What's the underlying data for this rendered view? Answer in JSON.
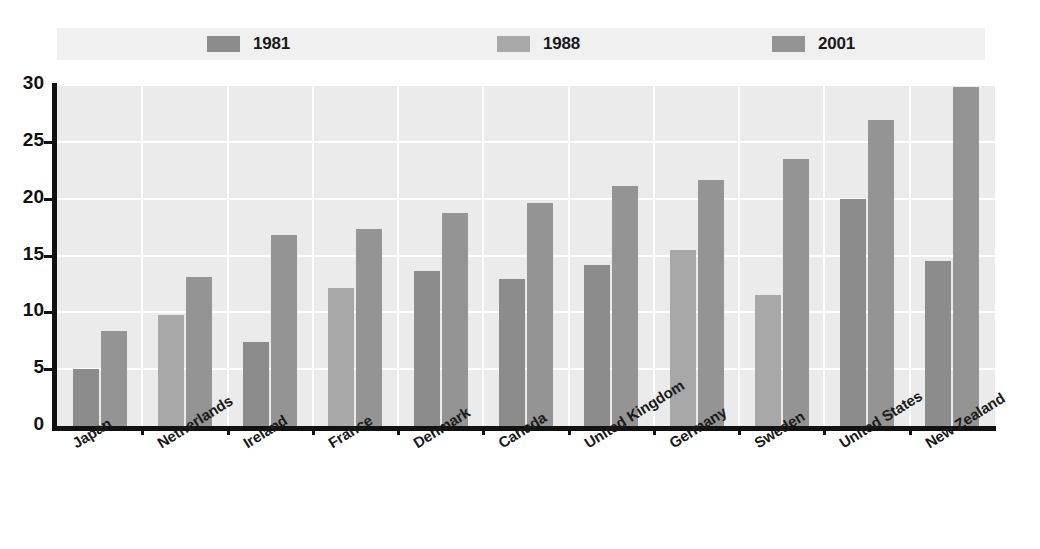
{
  "legend": {
    "entries": [
      {
        "label": "1981",
        "color": "#8c8c8c",
        "swatch_name": "legend-swatch-1981"
      },
      {
        "label": "1988",
        "color": "#a8a8a8",
        "swatch_name": "legend-swatch-1988"
      },
      {
        "label": "2001",
        "color": "#949494",
        "swatch_name": "legend-swatch-2001"
      }
    ],
    "background": "#f0f0f0"
  },
  "axes": {
    "y_ticks": [
      "0",
      "5",
      "10",
      "15",
      "20",
      "25",
      "30"
    ],
    "y_min": 0,
    "y_max": 30,
    "y_step": 5
  },
  "colors": {
    "plot_background": "#ebebeb",
    "gridline": "#ffffff",
    "axis": "#111111",
    "bar_1981": "#8c8c8c",
    "bar_1988": "#a8a8a8",
    "bar_2001": "#949494",
    "text": "#1a1a1a"
  },
  "chart_data": {
    "type": "bar",
    "title": "",
    "subtitle": "",
    "xlabel": "",
    "ylabel": "",
    "ylim": [
      0,
      30
    ],
    "grid": true,
    "legend_position": "top",
    "categories": [
      "Japan",
      "Netherlands",
      "Ireland",
      "France",
      "Denmark",
      "Canada",
      "United Kingdom",
      "Germany",
      "Sweden",
      "United States",
      "New Zealand"
    ],
    "series": [
      {
        "name": "1981",
        "color": "#8c8c8c",
        "values": [
          5.0,
          null,
          7.4,
          null,
          13.6,
          12.9,
          14.2,
          null,
          null,
          20.0,
          14.5
        ]
      },
      {
        "name": "1988",
        "color": "#a8a8a8",
        "values": [
          null,
          9.8,
          null,
          12.1,
          null,
          null,
          null,
          15.5,
          11.5,
          null,
          null
        ]
      },
      {
        "name": "2001",
        "color": "#949494",
        "values": [
          8.4,
          13.1,
          16.8,
          17.3,
          18.7,
          19.6,
          21.1,
          21.6,
          23.5,
          26.9,
          29.8
        ]
      }
    ]
  }
}
